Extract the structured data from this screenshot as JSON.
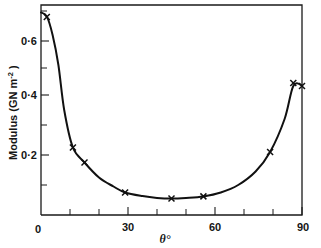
{
  "chart_data": {
    "type": "line",
    "title": "",
    "subtitle": "",
    "xlabel": "θ°",
    "ylabel": "Modulus (GN m⁻²)",
    "ylabel_main": "Modulus  (GN m",
    "ylabel_exponent": "-2",
    "ylabel_close": " )",
    "xlabel_symbol": "θ",
    "xlabel_degree": "°",
    "xlim": [
      0,
      90
    ],
    "ylim": [
      0,
      0.7
    ],
    "grid": false,
    "legend": "none",
    "marker_style": "x",
    "x_ticks_major": [
      0,
      30,
      60,
      90
    ],
    "x_tick_labels": [
      "0",
      "30",
      "60",
      "90"
    ],
    "x_ticks_minor": [
      10,
      20,
      40,
      50,
      70,
      80
    ],
    "y_ticks_major": [
      0.2,
      0.4,
      0.6
    ],
    "y_tick_labels": [
      "0·2",
      "0·4",
      "0·6"
    ],
    "y_ticks_minor": [
      0.1,
      0.3,
      0.5,
      0.7
    ],
    "origin_label": "0",
    "series": [
      {
        "name": "Modulus vs theta",
        "x": [
          2,
          11,
          15,
          29,
          45,
          56,
          79,
          87,
          90
        ],
        "values": [
          0.66,
          0.225,
          0.175,
          0.075,
          0.055,
          0.062,
          0.21,
          0.44,
          0.43
        ]
      }
    ],
    "curve_x": [
      0,
      2,
      4,
      6,
      8,
      11,
      15,
      20,
      25,
      29,
      35,
      40,
      45,
      50,
      56,
      62,
      68,
      74,
      79,
      84,
      87,
      90
    ],
    "curve_y": [
      0.675,
      0.662,
      0.6,
      0.5,
      0.35,
      0.225,
      0.175,
      0.125,
      0.095,
      0.075,
      0.063,
      0.057,
      0.055,
      0.057,
      0.062,
      0.075,
      0.1,
      0.145,
      0.21,
      0.32,
      0.43,
      0.432
    ]
  }
}
